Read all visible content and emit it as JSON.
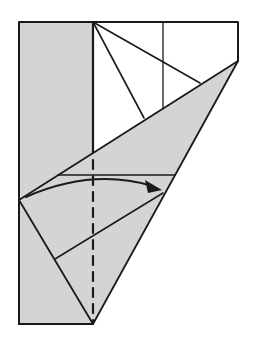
{
  "diagram": {
    "type": "origami-step",
    "colors": {
      "paper_back": "#d4d4d4",
      "paper_front": "#ffffff",
      "line": "#1a1a1a"
    },
    "annotations": {
      "valley_fold": "dashed vertical line at center",
      "arrow": "curved arrow indicating fold from left to right"
    }
  }
}
